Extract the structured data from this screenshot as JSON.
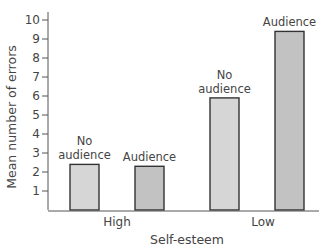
{
  "chart_data": {
    "type": "bar",
    "title": "",
    "xlabel": "Self-esteem",
    "ylabel": "Mean number of errors",
    "ylim": [
      0,
      10
    ],
    "yticks": [
      1,
      2,
      3,
      4,
      5,
      6,
      7,
      8,
      9,
      10
    ],
    "grid": false,
    "legend": "none (bars directly labeled)",
    "categories": [
      "High",
      "Low"
    ],
    "series": [
      {
        "name": "No audience",
        "values": [
          2.4,
          5.9
        ],
        "color": "#d6d6d6"
      },
      {
        "name": "Audience",
        "values": [
          2.3,
          9.4
        ],
        "color": "#c2c2c2"
      }
    ],
    "bars": [
      {
        "group": "High",
        "label_lines": [
          "No",
          "audience"
        ],
        "value": 2.4,
        "color": "#d6d6d6"
      },
      {
        "group": "High",
        "label_lines": [
          "Audience"
        ],
        "value": 2.3,
        "color": "#c2c2c2"
      },
      {
        "group": "Low",
        "label_lines": [
          "No",
          "audience"
        ],
        "value": 5.9,
        "color": "#d6d6d6"
      },
      {
        "group": "Low",
        "label_lines": [
          "Audience"
        ],
        "value": 9.4,
        "color": "#c2c2c2"
      }
    ]
  },
  "colors": {
    "axis": "#555555",
    "bar_outline": "#333333",
    "text": "#444444"
  }
}
